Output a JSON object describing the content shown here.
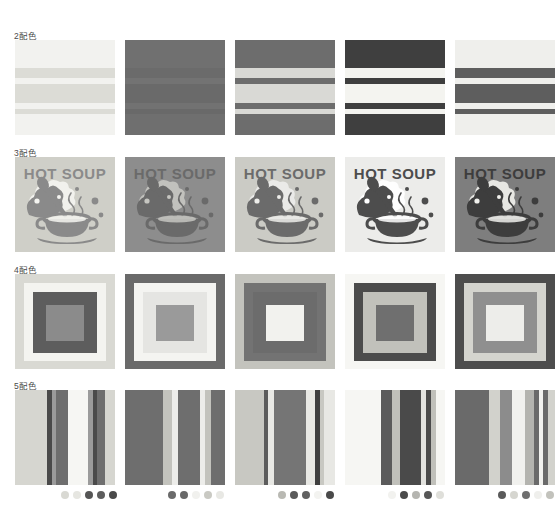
{
  "page": {
    "background": "#ffffff",
    "columns": 5,
    "rows": 4
  },
  "rows": [
    {
      "label": "2配色",
      "label_count": "2",
      "pattern": "horizontal-stripes",
      "top": 40,
      "swatches": [
        {
          "name": "swatch-2color-1",
          "palette": [
            "#f2f2ef",
            "#dcdcd6"
          ],
          "bands": [
            {
              "top": 0,
              "height": 28,
              "color": "#f2f2ef"
            },
            {
              "top": 28,
              "height": 10,
              "color": "#dcdcd6"
            },
            {
              "top": 38,
              "height": 6,
              "color": "#f2f2ef"
            },
            {
              "top": 44,
              "height": 19,
              "color": "#dcdcd6"
            },
            {
              "top": 63,
              "height": 6,
              "color": "#f2f2ef"
            },
            {
              "top": 69,
              "height": 5,
              "color": "#dcdcd6"
            },
            {
              "top": 74,
              "height": 21,
              "color": "#f2f2ef"
            }
          ]
        },
        {
          "name": "swatch-2color-2",
          "palette": [
            "#6e6e6e",
            "#6a6a6a"
          ],
          "bands": [
            {
              "top": 0,
              "height": 28,
              "color": "#707070"
            },
            {
              "top": 28,
              "height": 10,
              "color": "#6b6b6b"
            },
            {
              "top": 38,
              "height": 6,
              "color": "#737373"
            },
            {
              "top": 44,
              "height": 19,
              "color": "#6a6a6a"
            },
            {
              "top": 63,
              "height": 6,
              "color": "#727272"
            },
            {
              "top": 69,
              "height": 5,
              "color": "#696969"
            },
            {
              "top": 74,
              "height": 21,
              "color": "#6f6f6f"
            }
          ]
        },
        {
          "name": "swatch-2color-3",
          "palette": [
            "#6d6d6d",
            "#d6d6d2"
          ],
          "bands": [
            {
              "top": 0,
              "height": 28,
              "color": "#6d6d6d"
            },
            {
              "top": 28,
              "height": 10,
              "color": "#d9d9d5"
            },
            {
              "top": 38,
              "height": 6,
              "color": "#6d6d6d"
            },
            {
              "top": 44,
              "height": 19,
              "color": "#d9d9d5"
            },
            {
              "top": 63,
              "height": 6,
              "color": "#6d6d6d"
            },
            {
              "top": 69,
              "height": 5,
              "color": "#d9d9d5"
            },
            {
              "top": 74,
              "height": 21,
              "color": "#6d6d6d"
            }
          ]
        },
        {
          "name": "swatch-2color-4",
          "palette": [
            "#3f3f3f",
            "#f4f4f0"
          ],
          "bands": [
            {
              "top": 0,
              "height": 28,
              "color": "#3f3f3f"
            },
            {
              "top": 28,
              "height": 10,
              "color": "#f4f4f0"
            },
            {
              "top": 38,
              "height": 6,
              "color": "#3f3f3f"
            },
            {
              "top": 44,
              "height": 19,
              "color": "#f4f4f0"
            },
            {
              "top": 63,
              "height": 6,
              "color": "#3f3f3f"
            },
            {
              "top": 69,
              "height": 5,
              "color": "#f4f4f0"
            },
            {
              "top": 74,
              "height": 21,
              "color": "#3f3f3f"
            }
          ]
        },
        {
          "name": "swatch-2color-5",
          "palette": [
            "#efefec",
            "#5e5e5e"
          ],
          "bands": [
            {
              "top": 0,
              "height": 28,
              "color": "#efefec"
            },
            {
              "top": 28,
              "height": 10,
              "color": "#5e5e5e"
            },
            {
              "top": 38,
              "height": 6,
              "color": "#efefec"
            },
            {
              "top": 44,
              "height": 19,
              "color": "#5e5e5e"
            },
            {
              "top": 63,
              "height": 6,
              "color": "#efefec"
            },
            {
              "top": 69,
              "height": 5,
              "color": "#5e5e5e"
            },
            {
              "top": 74,
              "height": 21,
              "color": "#efefec"
            }
          ]
        }
      ]
    },
    {
      "label": "3配色",
      "label_count": "3",
      "pattern": "soup-illustration",
      "top": 157,
      "artwork_text": "HOT SOUP",
      "swatches": [
        {
          "name": "swatch-3color-1",
          "palette": [
            "#cfcfc8",
            "#8f8f8f",
            "#f3f3ef"
          ],
          "bg": "#cfcfc8",
          "ink": "#8a8a8a",
          "light": "#f4f4f0"
        },
        {
          "name": "swatch-3color-2",
          "palette": [
            "#8a8a8a",
            "#6a6a6a",
            "#bdbdb8"
          ],
          "bg": "#8d8d8d",
          "ink": "#6a6a6a",
          "light": "#c6c6c1"
        },
        {
          "name": "swatch-3color-3",
          "palette": [
            "#c9c9c3",
            "#6a6a6a",
            "#e9e9e4"
          ],
          "bg": "#cbcbc5",
          "ink": "#6b6b6b",
          "light": "#ededea"
        },
        {
          "name": "swatch-3color-4",
          "palette": [
            "#ededea",
            "#4a4a4a",
            "#a8a8a4"
          ],
          "bg": "#ececea",
          "ink": "#4d4d4d",
          "light": "#ffffff"
        },
        {
          "name": "swatch-3color-5",
          "palette": [
            "#7c7c7c",
            "#3c3c3c",
            "#eeeeea"
          ],
          "bg": "#7e7e7e",
          "ink": "#3d3d3d",
          "light": "#f0f0ec"
        }
      ]
    },
    {
      "label": "4配色",
      "label_count": "4",
      "pattern": "nested-squares",
      "top": 274,
      "swatches": [
        {
          "name": "swatch-4color-1",
          "palette": [
            "#d9d9d3",
            "#f4f4f0",
            "#5d5d5d",
            "#8b8b8b"
          ],
          "layers": [
            "#d9d9d3",
            "#f4f4f0",
            "#5d5d5d",
            "#8b8b8b"
          ]
        },
        {
          "name": "swatch-4color-2",
          "palette": [
            "#6a6a6a",
            "#f4f4f1",
            "#ededea",
            "#9a9a9a"
          ],
          "layers": [
            "#6a6a6a",
            "#f4f4f1",
            "#e5e5e2",
            "#9a9a9a"
          ]
        },
        {
          "name": "swatch-4color-3",
          "palette": [
            "#c3c3bd",
            "#737373",
            "#6c6c6c",
            "#f2f2ee"
          ],
          "layers": [
            "#c3c3bd",
            "#737373",
            "#6c6c6c",
            "#f2f2ee"
          ]
        },
        {
          "name": "swatch-4color-4",
          "palette": [
            "#f6f6f3",
            "#4c4c4c",
            "#c1c1bb",
            "#6f6f6f"
          ],
          "layers": [
            "#f6f6f3",
            "#4c4c4c",
            "#c1c1bb",
            "#6f6f6f"
          ]
        },
        {
          "name": "swatch-4color-5",
          "palette": [
            "#4d4d4d",
            "#d4d4ce",
            "#8f8f8f",
            "#ededea"
          ],
          "layers": [
            "#4d4d4d",
            "#d4d4ce",
            "#8f8f8f",
            "#ededea"
          ]
        }
      ]
    },
    {
      "label": "5配色",
      "label_count": "5",
      "pattern": "vertical-stripes",
      "top": 390,
      "swatches": [
        {
          "name": "swatch-5color-1",
          "palette": [
            "#d6d6d0",
            "#4a4a4a",
            "#6e6e6e",
            "#f6f6f3",
            "#9b9b9b"
          ],
          "bands": [
            {
              "left": 0,
              "width": 32,
              "color": "#d6d6d0"
            },
            {
              "left": 32,
              "width": 5,
              "color": "#4a4a4a"
            },
            {
              "left": 37,
              "width": 4,
              "color": "#9b9b9b"
            },
            {
              "left": 41,
              "width": 12,
              "color": "#6e6e6e"
            },
            {
              "left": 53,
              "width": 20,
              "color": "#f6f6f3"
            },
            {
              "left": 73,
              "width": 5,
              "color": "#9b9b9b"
            },
            {
              "left": 78,
              "width": 4,
              "color": "#4a4a4a"
            },
            {
              "left": 82,
              "width": 8,
              "color": "#6e6e6e"
            },
            {
              "left": 90,
              "width": 10,
              "color": "#d6d6d0"
            }
          ]
        },
        {
          "name": "swatch-5color-2",
          "palette": [
            "#6e6e6e",
            "#c3c3bd",
            "#ededea",
            "#d0d0ca",
            "#8f8f8f"
          ],
          "bands": [
            {
              "left": 0,
              "width": 38,
              "color": "#6e6e6e"
            },
            {
              "left": 38,
              "width": 9,
              "color": "#c3c3bd"
            },
            {
              "left": 47,
              "width": 6,
              "color": "#ededea"
            },
            {
              "left": 53,
              "width": 22,
              "color": "#6e6e6e"
            },
            {
              "left": 75,
              "width": 5,
              "color": "#ededea"
            },
            {
              "left": 80,
              "width": 6,
              "color": "#c3c3bd"
            },
            {
              "left": 86,
              "width": 14,
              "color": "#6e6e6e"
            }
          ]
        },
        {
          "name": "swatch-5color-3",
          "palette": [
            "#c8c8c2",
            "#5c5c5c",
            "#e8e8e4",
            "#757575",
            "#3f3f3f"
          ],
          "bands": [
            {
              "left": 0,
              "width": 29,
              "color": "#c8c8c2"
            },
            {
              "left": 29,
              "width": 4,
              "color": "#5c5c5c"
            },
            {
              "left": 33,
              "width": 6,
              "color": "#e8e8e4"
            },
            {
              "left": 39,
              "width": 32,
              "color": "#757575"
            },
            {
              "left": 71,
              "width": 9,
              "color": "#e8e8e4"
            },
            {
              "left": 80,
              "width": 5,
              "color": "#3f3f3f"
            },
            {
              "left": 85,
              "width": 4,
              "color": "#c8c8c2"
            },
            {
              "left": 89,
              "width": 11,
              "color": "#e8e8e4"
            }
          ]
        },
        {
          "name": "swatch-5color-4",
          "palette": [
            "#f6f6f3",
            "#5b5b5b",
            "#c0c0ba",
            "#4a4a4a",
            "#e2e2de"
          ],
          "bands": [
            {
              "left": 0,
              "width": 36,
              "color": "#f6f6f3"
            },
            {
              "left": 36,
              "width": 11,
              "color": "#5b5b5b"
            },
            {
              "left": 47,
              "width": 8,
              "color": "#c0c0ba"
            },
            {
              "left": 55,
              "width": 21,
              "color": "#4a4a4a"
            },
            {
              "left": 76,
              "width": 5,
              "color": "#e2e2de"
            },
            {
              "left": 81,
              "width": 5,
              "color": "#4a4a4a"
            },
            {
              "left": 86,
              "width": 5,
              "color": "#c0c0ba"
            },
            {
              "left": 91,
              "width": 9,
              "color": "#f6f6f3"
            }
          ]
        },
        {
          "name": "swatch-5color-5",
          "palette": [
            "#6a6a6a",
            "#d2d2cc",
            "#8c8c8c",
            "#f1f1ee",
            "#b4b4af"
          ],
          "bands": [
            {
              "left": 0,
              "width": 34,
              "color": "#6a6a6a"
            },
            {
              "left": 34,
              "width": 11,
              "color": "#d2d2cc"
            },
            {
              "left": 45,
              "width": 12,
              "color": "#8c8c8c"
            },
            {
              "left": 57,
              "width": 13,
              "color": "#f1f1ee"
            },
            {
              "left": 70,
              "width": 9,
              "color": "#b4b4af"
            },
            {
              "left": 79,
              "width": 5,
              "color": "#6a6a6a"
            },
            {
              "left": 84,
              "width": 4,
              "color": "#f1f1ee"
            },
            {
              "left": 88,
              "width": 5,
              "color": "#6a6a6a"
            },
            {
              "left": 93,
              "width": 7,
              "color": "#d2d2cc"
            }
          ]
        }
      ]
    }
  ],
  "legends": [
    {
      "name": "legend-palette-1",
      "left": 61,
      "dots": [
        "#d9d9d3",
        "#e6e6e1",
        "#555555",
        "#5d5d5d",
        "#4a4a4a"
      ]
    },
    {
      "name": "legend-palette-2",
      "left": 168,
      "dots": [
        "#6a6a6a",
        "#696969",
        "#f1f1ee",
        "#c9c9c3",
        "#e8e8e4"
      ]
    },
    {
      "name": "legend-palette-3",
      "left": 278,
      "dots": [
        "#b9b9b3",
        "#5a5a5a",
        "#616161",
        "#f3f3f0",
        "#4a4a4a"
      ]
    },
    {
      "name": "legend-palette-4",
      "left": 388,
      "dots": [
        "#f2f2ef",
        "#4b4b4b",
        "#b5b5b0",
        "#575757",
        "#dfdfda"
      ]
    },
    {
      "name": "legend-palette-5",
      "left": 498,
      "dots": [
        "#5a5a5a",
        "#d6d6d0",
        "#6f6f6f",
        "#efefec",
        "#c2c2bc"
      ]
    }
  ]
}
